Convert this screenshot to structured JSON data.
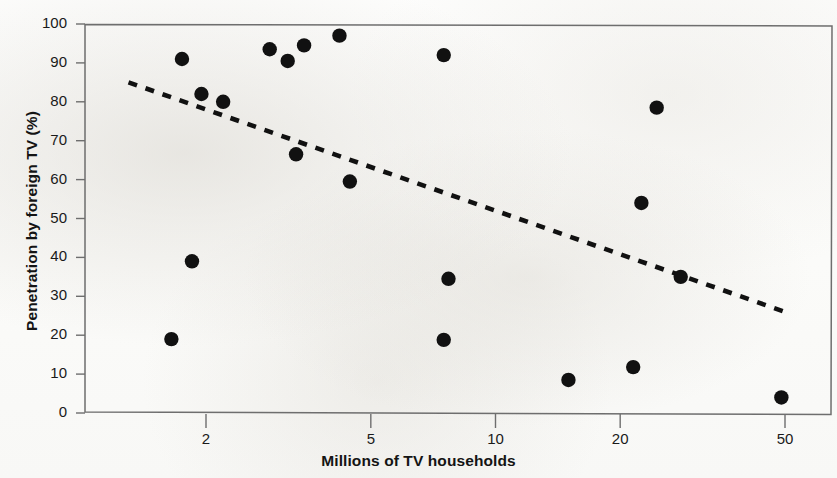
{
  "figure": {
    "background_color": "#fdfdfc",
    "frame_color": "#6e6e6e",
    "marker_color": "#111111",
    "trendline_color": "#111111"
  },
  "axes": {
    "y_title": "Penetration by foreign TV (%)",
    "x_title": "Millions of TV households"
  },
  "chart_data": {
    "type": "scatter",
    "title": "",
    "subtitle": "",
    "xlabel": "Millions of TV households",
    "ylabel": "Penetration by foreign TV (%)",
    "x_scale": "log",
    "y_scale": "linear",
    "xlim": [
      1.25,
      56
    ],
    "ylim": [
      0,
      100
    ],
    "x_ticks": [
      2,
      5,
      10,
      20,
      50
    ],
    "x_tick_labels": [
      "2",
      "5",
      "10",
      "20",
      "50"
    ],
    "y_ticks": [
      0,
      10,
      20,
      30,
      40,
      50,
      60,
      70,
      80,
      90,
      100
    ],
    "y_tick_labels": [
      "0",
      "10",
      "20",
      "30",
      "40",
      "50",
      "60",
      "70",
      "80",
      "90",
      "100"
    ],
    "grid": false,
    "legend": null,
    "legend_position": "none",
    "points": [
      {
        "x": 1.75,
        "y": 91.0
      },
      {
        "x": 1.85,
        "y": 39.0
      },
      {
        "x": 1.65,
        "y": 19.0
      },
      {
        "x": 1.95,
        "y": 82.0
      },
      {
        "x": 2.2,
        "y": 80.0
      },
      {
        "x": 2.85,
        "y": 93.5
      },
      {
        "x": 3.15,
        "y": 90.5
      },
      {
        "x": 3.45,
        "y": 94.5
      },
      {
        "x": 3.3,
        "y": 66.5
      },
      {
        "x": 4.2,
        "y": 97.0
      },
      {
        "x": 4.45,
        "y": 59.5
      },
      {
        "x": 7.5,
        "y": 92.0
      },
      {
        "x": 7.7,
        "y": 34.5
      },
      {
        "x": 7.5,
        "y": 18.8
      },
      {
        "x": 15.0,
        "y": 8.5
      },
      {
        "x": 21.5,
        "y": 11.8
      },
      {
        "x": 22.5,
        "y": 54.0
      },
      {
        "x": 24.5,
        "y": 78.5
      },
      {
        "x": 28.0,
        "y": 35.0
      },
      {
        "x": 49.0,
        "y": 4.0
      }
    ],
    "trendline": {
      "style": "dashed",
      "x_start": 1.3,
      "y_start": 85.0,
      "x_end": 50.0,
      "y_end": 26.0
    }
  }
}
